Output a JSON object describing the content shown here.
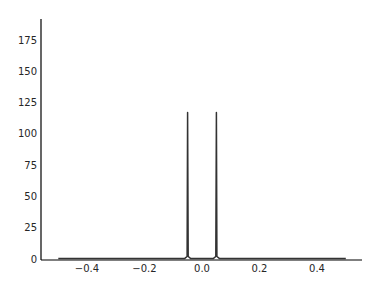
{
  "chart_data": {
    "type": "line",
    "title": "",
    "xlabel": "",
    "ylabel": "",
    "xlim": [
      -0.55,
      0.55
    ],
    "ylim": [
      0,
      190
    ],
    "grid": false,
    "legend": null,
    "x_ticks": [
      "−0.4",
      "−0.2",
      "0.0",
      "0.2",
      "0.4"
    ],
    "x_tick_values": [
      -0.4,
      -0.2,
      0.0,
      0.2,
      0.4
    ],
    "y_ticks": [
      "0",
      "25",
      "50",
      "75",
      "100",
      "125",
      "150",
      "175"
    ],
    "y_tick_values": [
      0,
      25,
      50,
      75,
      100,
      125,
      150,
      175
    ],
    "series": [
      {
        "name": "spectrum",
        "color": "#333333",
        "x": [
          -0.5,
          -0.06,
          -0.052,
          -0.05,
          -0.048,
          -0.04,
          0.04,
          0.048,
          0.05,
          0.052,
          0.06,
          0.5
        ],
        "y": [
          0.5,
          0.5,
          2,
          117,
          2,
          0.5,
          0.5,
          2,
          117,
          2,
          0.5,
          0.5
        ]
      }
    ],
    "annotations": []
  }
}
